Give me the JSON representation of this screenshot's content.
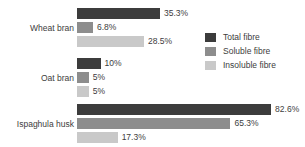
{
  "chart_data": {
    "type": "bar",
    "orientation": "horizontal",
    "title": "",
    "subtitle": "",
    "xlabel": "",
    "ylabel": "",
    "grid": false,
    "xlim": [
      0,
      100
    ],
    "categories": [
      "Wheat bran",
      "Oat bran",
      "Ispaghula husk"
    ],
    "legend_position": "right",
    "series": [
      {
        "name": "Total fibre",
        "color": "#3c3c3c",
        "values": [
          35.3,
          10,
          82.6
        ],
        "labels": [
          "35.3%",
          "10%",
          "82.6%"
        ]
      },
      {
        "name": "Soluble fibre",
        "color": "#8d8d8d",
        "values": [
          6.8,
          5,
          65.3
        ],
        "labels": [
          "6.8%",
          "5%",
          "65.3%"
        ]
      },
      {
        "name": "Insoluble fibre",
        "color": "#c9c9c9",
        "values": [
          28.5,
          5,
          17.3
        ],
        "labels": [
          "28.5%",
          "5%",
          "17.3%"
        ]
      }
    ]
  },
  "groups": [
    {
      "label": "Wheat bran",
      "bars": [
        {
          "series": "Total fibre",
          "value": 35.3,
          "label": "35.3%",
          "kind": "total"
        },
        {
          "series": "Soluble fibre",
          "value": 6.8,
          "label": "6.8%",
          "kind": "soluble"
        },
        {
          "series": "Insoluble fibre",
          "value": 28.5,
          "label": "28.5%",
          "kind": "insol"
        }
      ]
    },
    {
      "label": "Oat bran",
      "bars": [
        {
          "series": "Total fibre",
          "value": 10,
          "label": "10%",
          "kind": "total"
        },
        {
          "series": "Soluble fibre",
          "value": 5,
          "label": "5%",
          "kind": "soluble"
        },
        {
          "series": "Insoluble fibre",
          "value": 5,
          "label": "5%",
          "kind": "insol"
        }
      ]
    },
    {
      "label": "Ispaghula husk",
      "bars": [
        {
          "series": "Total fibre",
          "value": 82.6,
          "label": "82.6%",
          "kind": "total"
        },
        {
          "series": "Soluble fibre",
          "value": 65.3,
          "label": "65.3%",
          "kind": "soluble"
        },
        {
          "series": "Insoluble fibre",
          "value": 17.3,
          "label": "17.3%",
          "kind": "insol"
        }
      ]
    }
  ],
  "legend": {
    "items": [
      {
        "label": "Total fibre",
        "kind": "total",
        "color": "#3c3c3c"
      },
      {
        "label": "Soluble fibre",
        "kind": "soluble",
        "color": "#8d8d8d"
      },
      {
        "label": "Insoluble fibre",
        "kind": "insol",
        "color": "#c9c9c9"
      }
    ]
  },
  "style": {
    "background": "#ffffff",
    "text_color": "#3d3d3d",
    "px_per_percent": 2.35,
    "bar_origin_x": 77,
    "bar_height": 11,
    "bar_gap": 3,
    "group_tops": [
      8,
      58,
      104
    ]
  }
}
